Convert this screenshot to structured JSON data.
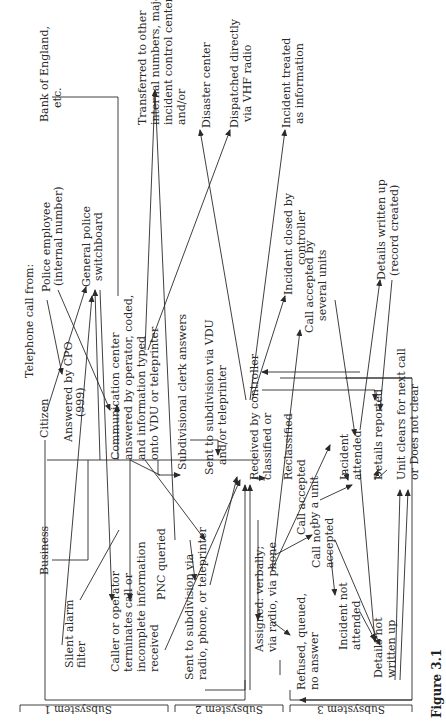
{
  "figure": {
    "caption": "Figure 3.1",
    "orientation": "rotated 90° counter-clockwise"
  },
  "subsystems": [
    {
      "label": "Subsystem 1"
    },
    {
      "label": "Subsystem 2"
    },
    {
      "label": "Subsystem 3"
    }
  ],
  "nodes": {
    "header": "Telephone call from:",
    "bank": [
      "Bank of England,",
      "etc."
    ],
    "police_employee": [
      "Police employee",
      "(internal number)"
    ],
    "switchboard": [
      "General police",
      "switchboard"
    ],
    "citizen": "Citizen",
    "cpo": [
      "Answered by CPO",
      "(999)"
    ],
    "business": "Business",
    "silent_alarm": [
      "Silent alarm",
      "filter"
    ],
    "comm_center": [
      "Communication center",
      "answered by operator, coded,",
      "and information typed",
      "onto VDU or teleprinter"
    ],
    "caller_terminates": [
      "Caller or operator",
      "terminates call or",
      "incomplete information",
      "received"
    ],
    "transferred": [
      "Transferred to other",
      "internal numbers, major",
      "incident control center",
      "and/or"
    ],
    "subdiv_clerk": "Subdivisional clerk answers",
    "sent_vdu": [
      "Sent to subdivision via VDU",
      "and/or teleprinter"
    ],
    "pnc": "PNC queried",
    "sent_radio": [
      "Sent to subdivision via",
      "radio, phone, or teleprinter"
    ],
    "disaster": "Disaster center",
    "vhf": [
      "Dispatched directly",
      "via VHF radio"
    ],
    "received": [
      "Received by controller",
      "classified or"
    ],
    "reclassified": "Reclassified",
    "info": [
      "Incident treated",
      "as information"
    ],
    "closed": [
      "Incident closed by",
      "controller"
    ],
    "assigned": [
      "Assigned: verbally;",
      "via radio, via phone"
    ],
    "refused": [
      "Refused, queued,",
      "no answer"
    ],
    "accepted_unit": [
      "Call accepted",
      "by a unit"
    ],
    "accepted_several": [
      "Call accepted by",
      "several units"
    ],
    "not_accepted": [
      "Call not",
      "accepted"
    ],
    "attended": [
      "Incident",
      "attended"
    ],
    "not_attended": [
      "Incident not",
      "attended"
    ],
    "written_up": [
      "Details written up",
      "(record created)"
    ],
    "reported": "Details reported",
    "not_written": [
      "Details not",
      "written up"
    ],
    "unit_clears": [
      "Unit clears for next call",
      "or Does not clear"
    ]
  }
}
